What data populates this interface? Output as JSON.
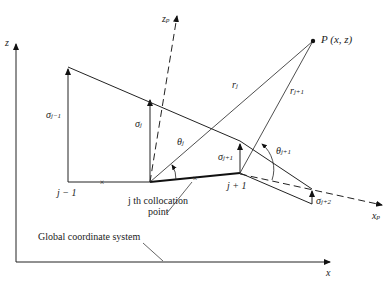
{
  "diagram": {
    "axes": {
      "global_z_label": "z",
      "global_x_label": "x",
      "panel_z_label": "z",
      "panel_z_sub": "p",
      "panel_x_label": "x",
      "panel_x_sub": "p"
    },
    "point": {
      "label": "P (x, z)"
    },
    "distances": [
      {
        "label": "r",
        "sub": "j"
      },
      {
        "label": "r",
        "sub": "j+1"
      }
    ],
    "sources": [
      {
        "label": "σ",
        "sub": "j−1"
      },
      {
        "label": "σ",
        "sub": "j"
      },
      {
        "label": "σ",
        "sub": "j+1"
      },
      {
        "label": "σ",
        "sub": "j+2"
      }
    ],
    "angles": [
      {
        "label": "θ",
        "sub": "j"
      },
      {
        "label": "θ",
        "sub": "j+1"
      }
    ],
    "nodes": [
      {
        "label": "j − 1"
      },
      {
        "label": "j + 1"
      }
    ],
    "annotations": {
      "collocation": "j th collocation",
      "collocation_line2": "point",
      "global_system": "Global coordinate system"
    }
  }
}
